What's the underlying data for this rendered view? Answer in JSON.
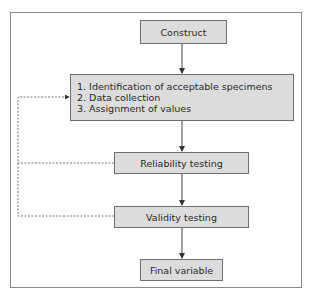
{
  "diagram": {
    "nodes": [
      {
        "id": "construct",
        "label": "Construct"
      },
      {
        "id": "process",
        "items": [
          "1. Identification of acceptable specimens",
          "2. Data collection",
          "3. Assignment of values"
        ]
      },
      {
        "id": "reliability",
        "label": "Reliability testing"
      },
      {
        "id": "validity",
        "label": "Validity testing"
      },
      {
        "id": "final",
        "label": "Final variable"
      }
    ],
    "edges": [
      {
        "from": "construct",
        "to": "process",
        "style": "solid"
      },
      {
        "from": "process",
        "to": "reliability",
        "style": "solid"
      },
      {
        "from": "reliability",
        "to": "validity",
        "style": "solid"
      },
      {
        "from": "validity",
        "to": "final",
        "style": "solid"
      },
      {
        "from": "reliability",
        "to": "process",
        "style": "dashed",
        "label": "feedback"
      },
      {
        "from": "validity",
        "to": "process",
        "style": "dashed",
        "label": "feedback"
      }
    ]
  },
  "colors": {
    "box_fill": "#dcdcdc",
    "box_border": "#6f6f6f",
    "line": "#444444",
    "frame": "#8a8a8a"
  }
}
